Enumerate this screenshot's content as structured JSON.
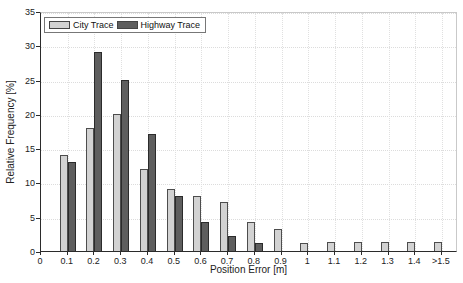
{
  "figure": {
    "background": "#ffffff",
    "axis_color": "#2b2b2b",
    "grid_color": "#dcdcdc"
  },
  "chart_data": {
    "type": "bar",
    "title": "",
    "xlabel": "Position Error [m]",
    "ylabel": "Relative Frequency [%]",
    "categories": [
      "0.1",
      "0.2",
      "0.3",
      "0.4",
      "0.5",
      "0.6",
      "0.7",
      "0.8",
      "0.9",
      "1",
      "1.1",
      "1.2",
      "1.3",
      "1.4",
      ">1.5"
    ],
    "x_axis_ticks": [
      "0",
      "0.1",
      "0.2",
      "0.3",
      "0.4",
      "0.5",
      "0.6",
      "0.7",
      "0.8",
      "0.9",
      "1",
      "1.1",
      "1.2",
      "1.3",
      "1.4",
      ">1.5"
    ],
    "series": [
      {
        "name": "City Trace",
        "color": "#d2d2d2",
        "border_color": "#4d4d4d",
        "values": [
          14,
          18,
          20,
          12,
          9,
          8,
          7.2,
          4.2,
          3.2,
          1.2,
          1.3,
          1.3,
          1.3,
          1.3,
          1.3
        ]
      },
      {
        "name": "Highway Trace",
        "color": "#5e5e5e",
        "border_color": "#2b2b2b",
        "values": [
          13,
          29,
          25,
          17,
          8,
          4.2,
          2.2,
          1.2,
          0,
          0,
          0,
          0,
          0,
          0,
          0
        ]
      }
    ],
    "ylim": [
      0,
      35
    ],
    "yticks": [
      0,
      5,
      10,
      15,
      20,
      25,
      30,
      35
    ],
    "grid": true,
    "legend_position": "top-left"
  }
}
